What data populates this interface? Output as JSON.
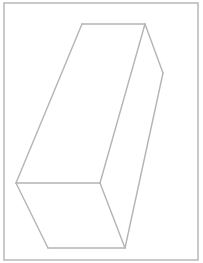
{
  "diagram": {
    "type": "3D rectangular prism line drawing",
    "stroke_color": "#b4b4b4",
    "frame_color": "#b8b8b8",
    "background": "#ffffff",
    "frame": {
      "x": 4,
      "y": 3,
      "w": 194,
      "h": 257
    },
    "edges": [
      {
        "id": "top-edge",
        "x1": 82,
        "y1": 24,
        "x2": 145,
        "y2": 24
      },
      {
        "id": "top-right-slant",
        "x1": 145,
        "y1": 24,
        "x2": 163,
        "y2": 73
      },
      {
        "id": "right-long-edge",
        "x1": 163,
        "y1": 73,
        "x2": 125,
        "y2": 248
      },
      {
        "id": "left-long-edge",
        "x1": 82,
        "y1": 24,
        "x2": 16,
        "y2": 183
      },
      {
        "id": "middle-long-edge",
        "x1": 145,
        "y1": 24,
        "x2": 100,
        "y2": 183
      },
      {
        "id": "front-top-edge",
        "x1": 16,
        "y1": 183,
        "x2": 100,
        "y2": 183
      },
      {
        "id": "front-left-edge",
        "x1": 16,
        "y1": 183,
        "x2": 48,
        "y2": 248
      },
      {
        "id": "front-right-edge",
        "x1": 100,
        "y1": 183,
        "x2": 125,
        "y2": 248
      },
      {
        "id": "bottom-edge",
        "x1": 48,
        "y1": 248,
        "x2": 125,
        "y2": 248
      }
    ]
  }
}
